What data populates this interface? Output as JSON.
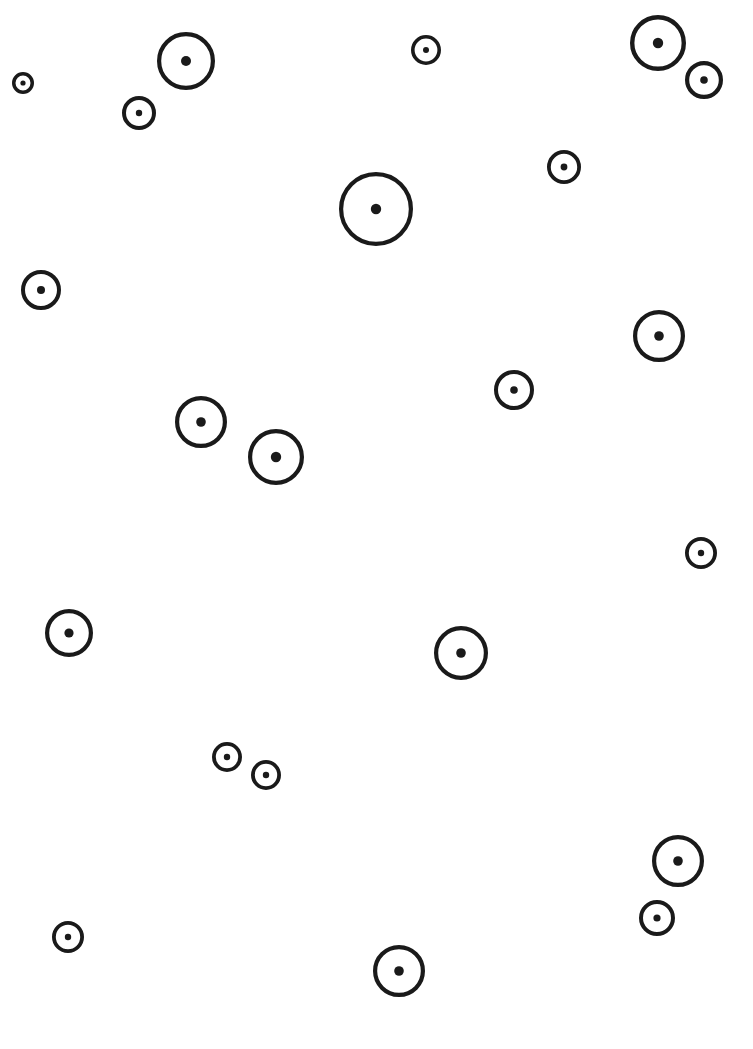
{
  "page": {
    "width": 753,
    "height": 1049,
    "background_color": "#ffffff",
    "stroke_color": "#1a1a1a",
    "dot_color": "#1a1a1a"
  },
  "chart_data": {
    "type": "scatter",
    "title": "",
    "subtitle": "",
    "xlabel": "",
    "ylabel": "",
    "xlim": [
      0,
      753
    ],
    "ylim": [
      0,
      1049
    ],
    "grid": false,
    "legend": null,
    "annotations": [],
    "tick_labels": {
      "x": [],
      "y": []
    },
    "marker_style": {
      "shape": "ring-with-center-dot",
      "ring_fill": "none",
      "ring_stroke": "#1a1a1a",
      "center_dot_fill": "#1a1a1a"
    },
    "point_count": 22,
    "points": [
      {
        "id": "p01",
        "x": 23,
        "y": 83,
        "r": 11,
        "ring_width": 3.5,
        "dot_r": 2.6
      },
      {
        "id": "p02",
        "x": 186,
        "y": 61,
        "r": 29,
        "ring_width": 4.2,
        "dot_r": 5.0
      },
      {
        "id": "p03",
        "x": 139,
        "y": 113,
        "r": 17,
        "ring_width": 4.0,
        "dot_r": 3.2
      },
      {
        "id": "p04",
        "x": 426,
        "y": 50,
        "r": 15,
        "ring_width": 3.6,
        "dot_r": 3.0
      },
      {
        "id": "p05",
        "x": 658,
        "y": 43,
        "r": 28,
        "ring_width": 4.4,
        "dot_r": 5.2
      },
      {
        "id": "p06",
        "x": 704,
        "y": 80,
        "r": 19,
        "ring_width": 4.2,
        "dot_r": 3.8
      },
      {
        "id": "p07",
        "x": 564,
        "y": 167,
        "r": 17,
        "ring_width": 3.8,
        "dot_r": 3.4
      },
      {
        "id": "p08",
        "x": 376,
        "y": 209,
        "r": 37,
        "ring_width": 4.2,
        "dot_r": 5.2
      },
      {
        "id": "p09",
        "x": 41,
        "y": 290,
        "r": 20,
        "ring_width": 4.0,
        "dot_r": 4.0
      },
      {
        "id": "p10",
        "x": 659,
        "y": 336,
        "r": 26,
        "ring_width": 4.2,
        "dot_r": 4.8
      },
      {
        "id": "p11",
        "x": 514,
        "y": 390,
        "r": 20,
        "ring_width": 4.0,
        "dot_r": 3.8
      },
      {
        "id": "p12",
        "x": 201,
        "y": 422,
        "r": 26,
        "ring_width": 4.2,
        "dot_r": 4.8
      },
      {
        "id": "p13",
        "x": 276,
        "y": 457,
        "r": 28,
        "ring_width": 4.2,
        "dot_r": 5.2
      },
      {
        "id": "p14",
        "x": 701,
        "y": 553,
        "r": 16,
        "ring_width": 3.8,
        "dot_r": 3.2
      },
      {
        "id": "p15",
        "x": 69,
        "y": 633,
        "r": 24,
        "ring_width": 4.2,
        "dot_r": 4.6
      },
      {
        "id": "p16",
        "x": 461,
        "y": 653,
        "r": 27,
        "ring_width": 4.2,
        "dot_r": 4.8
      },
      {
        "id": "p17",
        "x": 227,
        "y": 757,
        "r": 15,
        "ring_width": 3.8,
        "dot_r": 3.2
      },
      {
        "id": "p18",
        "x": 266,
        "y": 775,
        "r": 15,
        "ring_width": 3.8,
        "dot_r": 3.2
      },
      {
        "id": "p19",
        "x": 678,
        "y": 861,
        "r": 26,
        "ring_width": 4.2,
        "dot_r": 4.8
      },
      {
        "id": "p20",
        "x": 657,
        "y": 918,
        "r": 18,
        "ring_width": 4.0,
        "dot_r": 3.6
      },
      {
        "id": "p21",
        "x": 68,
        "y": 937,
        "r": 16,
        "ring_width": 3.8,
        "dot_r": 3.2
      },
      {
        "id": "p22",
        "x": 399,
        "y": 971,
        "r": 26,
        "ring_width": 4.2,
        "dot_r": 4.8
      }
    ]
  }
}
